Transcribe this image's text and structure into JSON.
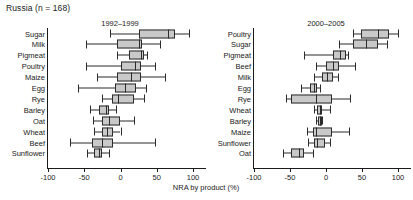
{
  "title": "Russia (n = 168)",
  "axis": {
    "xlabel": "NRA by product (%)",
    "ticks": [
      "-100",
      "-50",
      "0",
      "50",
      "100"
    ],
    "min": -100,
    "max": 100
  },
  "panels": [
    {
      "label": "1992–1999"
    },
    {
      "label": "2000–2005"
    }
  ],
  "chart_data": {
    "type": "box",
    "title": "Russia (n = 168)",
    "xlabel": "NRA by product (%)",
    "ylabel": "",
    "xlim": [
      -100,
      100
    ],
    "xticks": [
      -100,
      -50,
      0,
      50,
      100
    ],
    "grid": false,
    "legend": null,
    "panels": [
      {
        "label": "1992–1999",
        "categories": [
          "Sugar",
          "Milk",
          "Pigmeat",
          "Poultry",
          "Maize",
          "Egg",
          "Rye",
          "Barley",
          "Oat",
          "Wheat",
          "Beef",
          "Sunflower"
        ],
        "boxes": [
          {
            "category": "Sugar",
            "whisker_low": -15,
            "q1": 25,
            "median": 65,
            "q3": 75,
            "whisker_high": 95
          },
          {
            "category": "Milk",
            "whisker_low": -48,
            "q1": -5,
            "median": 25,
            "q3": 30,
            "whisker_high": 55
          },
          {
            "category": "Pigmeat",
            "whisker_low": -5,
            "q1": 12,
            "median": 28,
            "q3": 32,
            "whisker_high": 36
          },
          {
            "category": "Poultry",
            "whisker_low": -48,
            "q1": 0,
            "median": 20,
            "q3": 28,
            "whisker_high": 48
          },
          {
            "category": "Maize",
            "whisker_low": -32,
            "q1": -5,
            "median": 14,
            "q3": 28,
            "whisker_high": 62
          },
          {
            "category": "Egg",
            "whisker_low": -58,
            "q1": -8,
            "median": 6,
            "q3": 22,
            "whisker_high": 35
          },
          {
            "category": "Rye",
            "whisker_low": -26,
            "q1": -12,
            "median": -4,
            "q3": 18,
            "whisker_high": 32
          },
          {
            "category": "Barley",
            "whisker_low": -42,
            "q1": -30,
            "median": -20,
            "q3": -16,
            "whisker_high": -6
          },
          {
            "category": "Oat",
            "whisker_low": -38,
            "q1": -26,
            "median": -16,
            "q3": 0,
            "whisker_high": 18
          },
          {
            "category": "Wheat",
            "whisker_low": -36,
            "q1": -26,
            "median": -18,
            "q3": -10,
            "whisker_high": 0
          },
          {
            "category": "Beef",
            "whisker_low": -70,
            "q1": -40,
            "median": -25,
            "q3": -10,
            "whisker_high": 48
          },
          {
            "category": "Sunflower",
            "whisker_low": -46,
            "q1": -36,
            "median": -30,
            "q3": -25,
            "whisker_high": -16
          }
        ]
      },
      {
        "label": "2000–2005",
        "categories": [
          "Poultry",
          "Sugar",
          "Pigmeat",
          "Beef",
          "Milk",
          "Egg",
          "Rye",
          "Wheat",
          "Barley",
          "Maize",
          "Sunflower",
          "Oat"
        ],
        "boxes": [
          {
            "category": "Poultry",
            "whisker_low": 38,
            "q1": 48,
            "median": 72,
            "q3": 88,
            "whisker_high": 100
          },
          {
            "category": "Sugar",
            "whisker_low": 18,
            "q1": 38,
            "median": 55,
            "q3": 72,
            "whisker_high": 85
          },
          {
            "category": "Pigmeat",
            "whisker_low": -30,
            "q1": 10,
            "median": 20,
            "q3": 28,
            "whisker_high": 30
          },
          {
            "category": "Beef",
            "whisker_low": -14,
            "q1": 0,
            "median": 10,
            "q3": 18,
            "whisker_high": 40
          },
          {
            "category": "Milk",
            "whisker_low": -16,
            "q1": -6,
            "median": 2,
            "q3": 10,
            "whisker_high": 16
          },
          {
            "category": "Egg",
            "whisker_low": -35,
            "q1": -22,
            "median": -16,
            "q3": -12,
            "whisker_high": -8
          },
          {
            "category": "Rye",
            "whisker_low": -56,
            "q1": -48,
            "median": -14,
            "q3": 8,
            "whisker_high": 34
          },
          {
            "category": "Wheat",
            "whisker_low": -16,
            "q1": -12,
            "median": -9,
            "q3": -5,
            "whisker_high": 6
          },
          {
            "category": "Barley",
            "whisker_low": -14,
            "q1": -11,
            "median": -8,
            "q3": -6,
            "whisker_high": -5
          },
          {
            "category": "Maize",
            "whisker_low": -26,
            "q1": -18,
            "median": -14,
            "q3": 8,
            "whisker_high": 32
          },
          {
            "category": "Sunflower",
            "whisker_low": -25,
            "q1": -16,
            "median": -12,
            "q3": -2,
            "whisker_high": 6
          },
          {
            "category": "Oat",
            "whisker_low": -60,
            "q1": -48,
            "median": -38,
            "q3": -30,
            "whisker_high": -18
          }
        ]
      }
    ]
  }
}
